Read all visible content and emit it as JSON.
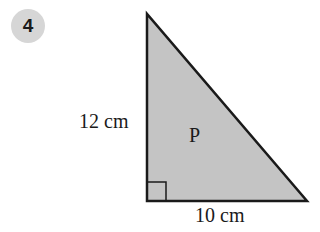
{
  "question_number": "4",
  "diagram": {
    "shape": "right triangle",
    "fill_color": "#c4c4c4",
    "stroke_color": "#1a1a1a",
    "vertical_side_label": "12 cm",
    "horizontal_side_label": "10 cm",
    "region_label": "P",
    "right_angle_marker": true
  }
}
